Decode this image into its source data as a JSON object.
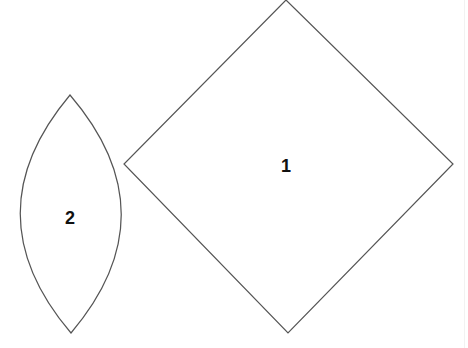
{
  "shapes": [
    {
      "id": "shape-1",
      "type": "diamond",
      "label": "1",
      "stroke": "#555555"
    },
    {
      "id": "shape-2",
      "type": "lens",
      "label": "2",
      "stroke": "#555555"
    }
  ]
}
